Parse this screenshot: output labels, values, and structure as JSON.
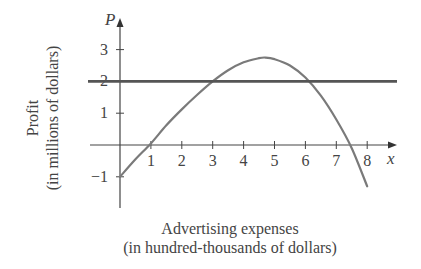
{
  "chart_data": {
    "type": "line",
    "title": "",
    "xlabel": "Advertising expenses",
    "xlabel_sub": "(in hundred-thousands of dollars)",
    "ylabel": "Profit",
    "ylabel_sub": "(in millions of dollars)",
    "x_axis_var": "x",
    "y_axis_var": "P",
    "x_ticks": [
      1,
      2,
      3,
      4,
      5,
      6,
      7,
      8
    ],
    "y_ticks": [
      -1,
      1,
      2,
      3
    ],
    "xlim": [
      -1,
      9
    ],
    "ylim": [
      -2,
      4
    ],
    "grid": false,
    "legend": "none",
    "series": [
      {
        "name": "Profit curve",
        "color": "#7a7a7a",
        "x": [
          0,
          0.5,
          1,
          1.5,
          2,
          2.5,
          3,
          3.5,
          4,
          4.5,
          4.7,
          5,
          5.5,
          6,
          6.5,
          7,
          7.5,
          8
        ],
        "y": [
          -1,
          -0.45,
          0.05,
          0.62,
          1.12,
          1.58,
          2.0,
          2.35,
          2.6,
          2.73,
          2.75,
          2.7,
          2.5,
          2.12,
          1.55,
          0.8,
          -0.1,
          -1.3
        ]
      },
      {
        "name": "Horizontal line P = 2",
        "color": "#555555",
        "x": [
          -1,
          8.9
        ],
        "y": [
          2,
          2
        ]
      }
    ]
  }
}
